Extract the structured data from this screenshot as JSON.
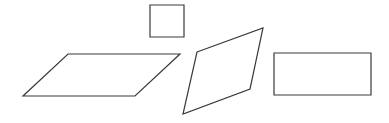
{
  "diagram": {
    "title": "",
    "stroke_color": "#3a3a3a",
    "background": "#ffffff",
    "shapes": [
      {
        "id": "square",
        "kind": "square",
        "points": "150,5 184,5 184,37 150,37"
      },
      {
        "id": "parallelogram",
        "kind": "parallelogram",
        "points": "68,54 180,54 135,96 23,96"
      },
      {
        "id": "rhombus",
        "kind": "rhombus",
        "points": "197,52 263,28 250,89 183,114"
      },
      {
        "id": "rectangle",
        "kind": "rectangle",
        "points": "274,53 371,53 371,95 274,95"
      }
    ]
  }
}
